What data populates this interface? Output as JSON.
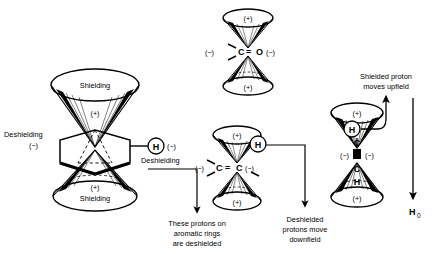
{
  "figure": {
    "background_color": "#ffffff",
    "ink_color": "#000000"
  },
  "signs": {
    "plus": "(+)",
    "minus": "(−)"
  },
  "benzene": {
    "top_cone_label": "Shielding",
    "top_cone_sign": "(+)",
    "bottom_cone_label": "Shielding",
    "bottom_cone_sign": "(+)",
    "left_label": "Deshielding",
    "left_sign": "(−)",
    "right_label": "Deshielding",
    "right_sign": "(−)",
    "proton": "H",
    "caption_line1": "These protons on",
    "caption_line2": "aromatic rings",
    "caption_line3": "are deshielded"
  },
  "carbonyl": {
    "top_sign": "(+)",
    "bottom_sign": "(+)",
    "left_sign": "(−)",
    "right_sign": "(−)",
    "atom_left": "C",
    "bond": "=",
    "atom_right": "O"
  },
  "alkene": {
    "top_sign": "(+)",
    "bottom_sign": "(+)",
    "left_sign": "(−)",
    "right_sign": "(−)",
    "atom_left": "C",
    "bond": "=",
    "atom_right": "C",
    "proton": "H",
    "caption_line1": "Deshielded",
    "caption_line2": "protons move",
    "caption_line3": "downfield"
  },
  "alkyne": {
    "top_sign": "(+)",
    "bottom_sign": "(+)",
    "left_sign": "(−)",
    "right_sign": "(−)",
    "atom_top_h": "H",
    "atom_top_c": "C",
    "atom_bottom_c": "C",
    "atom_bottom_h": "H",
    "proton": "H",
    "caption_line1": "Shielded proton",
    "caption_line2": "moves upfield"
  },
  "field_axis": {
    "label": "H",
    "subscript": "0",
    "direction": "down"
  }
}
